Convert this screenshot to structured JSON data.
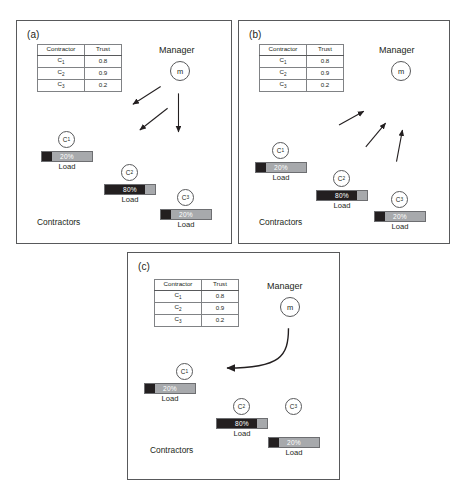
{
  "figure": {
    "panels": [
      {
        "id": "a",
        "label": "(a)",
        "manager_label": "Manager",
        "manager_node": "m",
        "contractors_label": "Contractors",
        "table": {
          "headers": [
            "Contractor",
            "Trust"
          ],
          "rows": [
            {
              "contractor": "C",
              "sub": "1",
              "trust": "0.8"
            },
            {
              "contractor": "C",
              "sub": "2",
              "trust": "0.9"
            },
            {
              "contractor": "C",
              "sub": "3",
              "trust": "0.2"
            }
          ]
        },
        "contractors": [
          {
            "node": "C",
            "sub": "1",
            "percent": "20%",
            "fill": 20,
            "caption": "Load"
          },
          {
            "node": "C",
            "sub": "2",
            "percent": "80%",
            "fill": 80,
            "caption": "Load"
          },
          {
            "node": "C",
            "sub": "3",
            "percent": "20%",
            "fill": 20,
            "caption": "Load"
          }
        ],
        "arrow_direction": "manager-to-contractors"
      },
      {
        "id": "b",
        "label": "(b)",
        "manager_label": "Manager",
        "manager_node": "m",
        "contractors_label": "Contractors",
        "table": {
          "headers": [
            "Contractor",
            "Trust"
          ],
          "rows": [
            {
              "contractor": "C",
              "sub": "1",
              "trust": "0.8"
            },
            {
              "contractor": "C",
              "sub": "2",
              "trust": "0.9"
            },
            {
              "contractor": "C",
              "sub": "3",
              "trust": "0.2"
            }
          ]
        },
        "contractors": [
          {
            "node": "C",
            "sub": "1",
            "percent": "20%",
            "fill": 20,
            "caption": "Load"
          },
          {
            "node": "C",
            "sub": "2",
            "percent": "80%",
            "fill": 80,
            "caption": "Load"
          },
          {
            "node": "C",
            "sub": "3",
            "percent": "20%",
            "fill": 20,
            "caption": "Load"
          }
        ],
        "arrow_direction": "contractors-to-manager"
      },
      {
        "id": "c",
        "label": "(c)",
        "manager_label": "Manager",
        "manager_node": "m",
        "contractors_label": "Contractors",
        "table": {
          "headers": [
            "Contractor",
            "Trust"
          ],
          "rows": [
            {
              "contractor": "C",
              "sub": "1",
              "trust": "0.8"
            },
            {
              "contractor": "C",
              "sub": "2",
              "trust": "0.9"
            },
            {
              "contractor": "C",
              "sub": "3",
              "trust": "0.2"
            }
          ]
        },
        "contractors": [
          {
            "node": "C",
            "sub": "1",
            "percent": "20%",
            "fill": 20,
            "caption": "Load"
          },
          {
            "node": "C",
            "sub": "2",
            "percent": "80%",
            "fill": 80,
            "caption": "Load"
          },
          {
            "node": "C",
            "sub": "3",
            "percent": "20%",
            "fill": 20,
            "caption": "Load"
          }
        ],
        "arrow_direction": "manager-to-c1-curved"
      }
    ],
    "colors": {
      "bar_fill": "#231f20",
      "bar_track": "#a7a9ac",
      "outline": "#58595b",
      "text": "#231f20",
      "percent_text": "#ffffff"
    }
  }
}
